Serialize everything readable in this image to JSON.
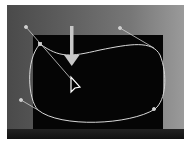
{
  "scene": {
    "description": "Photo of a dark monitor with a bezier path selection overlay",
    "colors": {
      "path": "#d8d8d8",
      "handle": "#cfcfcf",
      "arrow": "#c8c8c8",
      "cursor": "#ffffff"
    }
  },
  "icons": {
    "cursor": "pointer-arrow-icon",
    "arrow": "down-arrow-icon"
  }
}
